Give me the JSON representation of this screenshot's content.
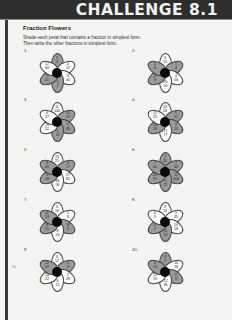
{
  "header": {
    "title": "CHALLENGE 8.1"
  },
  "page": {
    "title": "Fraction Flowers",
    "instructions": [
      "Shade each petal that contains a fraction in simplest form.",
      "Then write the other fractions in simplest form."
    ],
    "stray_mark": "%"
  },
  "colors": {
    "header_bg": "#2e2e2e",
    "shaded_petal": "#9a9a9a",
    "unshaded_petal": "#fdfdfd",
    "center": "#0a0a0a"
  },
  "flowers": [
    {
      "number": "1.",
      "petals": [
        {
          "text": "3\n4",
          "shaded": true
        },
        {
          "text": "4\n12",
          "shaded": false
        },
        {
          "text": "3\n40",
          "shaded": false
        },
        {
          "text": "5\n7",
          "shaded": true
        },
        {
          "text": "7\n11",
          "shaded": true
        },
        {
          "text": "12\n60",
          "shaded": false
        }
      ]
    },
    {
      "number": "2.",
      "petals": [
        {
          "text": "3\n15",
          "shaded": false
        },
        {
          "text": "1\n4",
          "shaded": true
        },
        {
          "text": "4\n16",
          "shaded": false
        },
        {
          "text": "20\n50",
          "shaded": false
        },
        {
          "text": "4\n9",
          "shaded": true
        },
        {
          "text": "5\n6",
          "shaded": true
        }
      ]
    },
    {
      "number": "3.",
      "petals": [
        {
          "text": "11\n100",
          "shaded": false
        },
        {
          "text": "11\n15",
          "shaded": true
        },
        {
          "text": "2\n45",
          "shaded": true
        },
        {
          "text": "5\n14",
          "shaded": true
        },
        {
          "text": "20\n52",
          "shaded": false
        },
        {
          "text": "6\n27",
          "shaded": false
        }
      ]
    },
    {
      "number": "4.",
      "petals": [
        {
          "text": "10\n18",
          "shaded": false
        },
        {
          "text": "5\n12",
          "shaded": true
        },
        {
          "text": "2\n15",
          "shaded": true
        },
        {
          "text": "21\n77",
          "shaded": false
        },
        {
          "text": "13\n18",
          "shaded": true
        },
        {
          "text": "15\n25",
          "shaded": false
        }
      ]
    },
    {
      "number": "5.",
      "petals": [
        {
          "text": "15\n21",
          "shaded": false
        },
        {
          "text": "4\n17",
          "shaded": true
        },
        {
          "text": "27\n81",
          "shaded": false
        },
        {
          "text": "36\n56",
          "shaded": false
        },
        {
          "text": "5\n18",
          "shaded": true
        },
        {
          "text": "8\n41",
          "shaded": true
        }
      ]
    },
    {
      "number": "6.",
      "petals": [
        {
          "text": "7\n11",
          "shaded": true
        },
        {
          "text": "7\n43",
          "shaded": true
        },
        {
          "text": "11\n100",
          "shaded": true
        },
        {
          "text": "2\n21",
          "shaded": true
        },
        {
          "text": "41\n97",
          "shaded": true
        },
        {
          "text": "7\n62",
          "shaded": true
        }
      ]
    },
    {
      "number": "7.",
      "petals": [
        {
          "text": "4\n16",
          "shaded": false
        },
        {
          "text": "5\n8",
          "shaded": false
        },
        {
          "text": "8\n9",
          "shaded": true
        },
        {
          "text": "8\n20",
          "shaded": false
        },
        {
          "text": "8\n15",
          "shaded": true
        },
        {
          "text": "11\n13",
          "shaded": true
        }
      ]
    },
    {
      "number": "8.",
      "petals": [
        {
          "text": "3\n18",
          "shaded": false
        },
        {
          "text": "9\n45",
          "shaded": false
        },
        {
          "text": "10\n18",
          "shaded": false
        },
        {
          "text": "11\n16",
          "shaded": true
        },
        {
          "text": "4\n7",
          "shaded": true
        },
        {
          "text": "6\n9",
          "shaded": false
        }
      ]
    },
    {
      "number": "9.",
      "petals": [
        {
          "text": "4\n12",
          "shaded": false
        },
        {
          "text": "5\n8",
          "shaded": true
        },
        {
          "text": "2\n49",
          "shaded": false
        },
        {
          "text": "6\n15",
          "shaded": false
        },
        {
          "text": "14\n22",
          "shaded": false
        },
        {
          "text": "11\n12",
          "shaded": true
        }
      ]
    },
    {
      "number": "10.",
      "petals": [
        {
          "text": "4\n5",
          "shaded": true
        },
        {
          "text": "16\n18",
          "shaded": false
        },
        {
          "text": "5\n9",
          "shaded": true
        },
        {
          "text": "12\n36",
          "shaded": false
        },
        {
          "text": "12\n19",
          "shaded": false
        },
        {
          "text": "5\n13",
          "shaded": true
        }
      ]
    }
  ]
}
